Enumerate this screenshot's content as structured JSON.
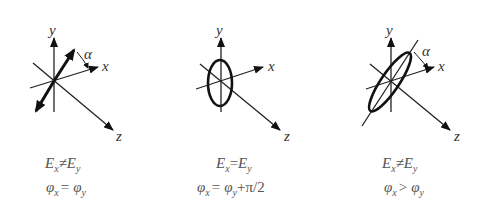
{
  "axis_labels": {
    "x": "x",
    "y": "y",
    "z": "z",
    "angle": "α"
  },
  "panels": [
    {
      "name": "linear-polarization",
      "condition_amplitude": {
        "lhs": "E",
        "lhs_sub": "x",
        "op": "≠",
        "rhs": "E",
        "rhs_sub": "y"
      },
      "condition_phase": {
        "lhs": "φ",
        "lhs_sub": "x",
        "op": "=",
        "rhs": "φ",
        "rhs_sub": "y",
        "extra": ""
      }
    },
    {
      "name": "circular-polarization",
      "condition_amplitude": {
        "lhs": "E",
        "lhs_sub": "x",
        "op": "=",
        "rhs": "E",
        "rhs_sub": "y"
      },
      "condition_phase": {
        "lhs": "φ",
        "lhs_sub": "x",
        "op": "=",
        "rhs": "φ",
        "rhs_sub": "y",
        "extra": "+π/2"
      }
    },
    {
      "name": "elliptical-polarization",
      "condition_amplitude": {
        "lhs": "E",
        "lhs_sub": "x",
        "op": "≠",
        "rhs": "E",
        "rhs_sub": "y"
      },
      "condition_phase": {
        "lhs": "φ",
        "lhs_sub": "x",
        "op": ">",
        "rhs": "φ",
        "rhs_sub": "y",
        "extra": ""
      }
    }
  ]
}
